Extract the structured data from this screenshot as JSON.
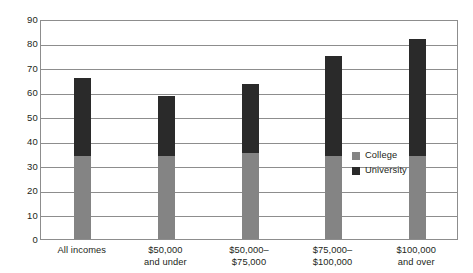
{
  "chart_data": {
    "type": "bar",
    "stacked": true,
    "title": "",
    "subtitle": "",
    "xlabel": "",
    "ylabel": "",
    "ylim": [
      0,
      90
    ],
    "yticks": [
      0,
      10,
      20,
      30,
      40,
      50,
      60,
      70,
      80,
      90
    ],
    "ytick_labels": [
      "0",
      "10",
      "20",
      "30",
      "40",
      "50",
      "60",
      "70",
      "80",
      "90"
    ],
    "grid": true,
    "legend_position": "right-inside",
    "categories": [
      "All incomes",
      "$50,000 and under",
      "$50,000–$75,000",
      "$75,000–$100,000",
      "$100,000 and over"
    ],
    "category_lines": [
      [
        "All incomes",
        ""
      ],
      [
        "$50,000",
        "and under"
      ],
      [
        "$50,000–",
        "$75,000"
      ],
      [
        "$75,000–",
        "$100,000"
      ],
      [
        "$100,000",
        "and over"
      ]
    ],
    "series": [
      {
        "name": "College",
        "color": "#848484",
        "values": [
          34,
          34,
          35,
          34,
          34
        ]
      },
      {
        "name": "University",
        "color": "#2a2a2a",
        "values": [
          32,
          24.5,
          28.5,
          41,
          48
        ]
      }
    ],
    "totals": [
      66,
      58.5,
      63.5,
      75,
      82
    ]
  },
  "legend": {
    "items": [
      {
        "label": "College",
        "color": "#848484"
      },
      {
        "label": "University",
        "color": "#2a2a2a"
      }
    ]
  },
  "axis": {
    "frame_color": "#8d8d8d"
  }
}
